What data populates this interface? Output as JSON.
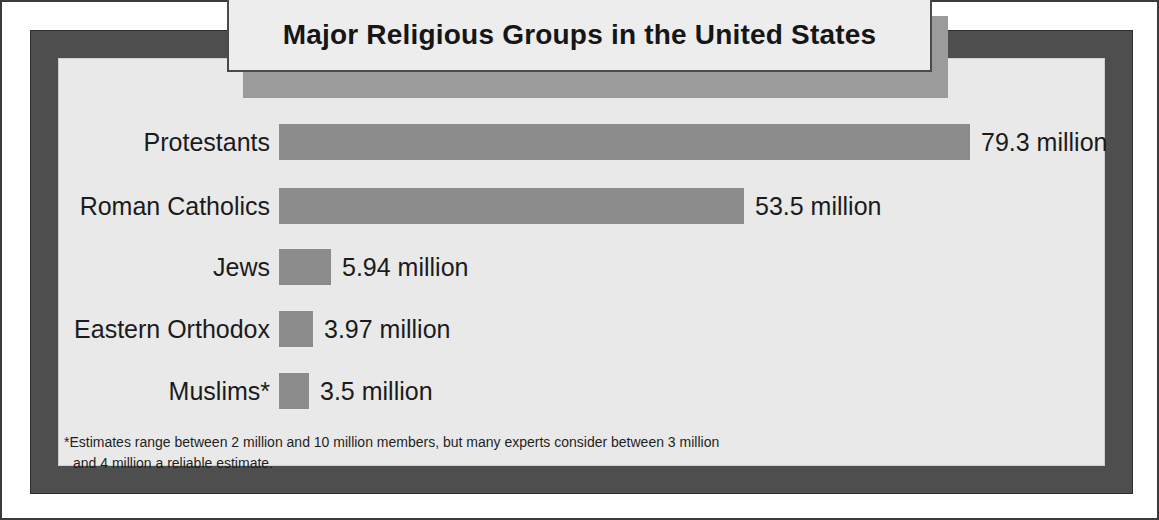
{
  "title": "Major Religious Groups  in the United States",
  "footnote": {
    "line1": "*Estimates range between 2 million and 10 million members, but many experts consider between 3 million",
    "line2": "and 4 million a reliable estimate."
  },
  "colors": {
    "bar": "#8c8c8c",
    "frame": "#4e4e4e",
    "panel": "#e9e9e9",
    "title_box": "#ededed",
    "title_shadow": "#9b9b9b",
    "text": "#1b1b1b"
  },
  "chart_data": {
    "type": "bar",
    "orientation": "horizontal",
    "title": "Major Religious Groups  in the United States",
    "xlabel": "",
    "ylabel": "",
    "unit": "million",
    "grid": false,
    "legend": false,
    "axis_visible": false,
    "categories": [
      "Protestants",
      "Roman Catholics",
      "Jews",
      "Eastern Orthodox",
      "Muslims*"
    ],
    "values": [
      79.3,
      53.5,
      5.94,
      3.97,
      3.5
    ],
    "value_labels": [
      "79.3 million",
      "53.5 million",
      "5.94 million",
      "3.97 million",
      "3.5 million"
    ],
    "bar_pixel_lengths": [
      691,
      465,
      52,
      34,
      30
    ],
    "xlim": [
      0,
      79.3
    ],
    "annotations": [
      "*Estimates range between 2 million and 10 million members, but many experts consider between 3 million and 4 million a reliable estimate."
    ]
  },
  "rows": [
    {
      "label": "Protestants",
      "value_label": "79.3 million",
      "top": 122,
      "bar_w": 691
    },
    {
      "label": "Roman Catholics",
      "value_label": "53.5 million",
      "top": 186,
      "bar_w": 465
    },
    {
      "label": "Jews",
      "value_label": "5.94 million",
      "top": 247,
      "bar_w": 52
    },
    {
      "label": "Eastern Orthodox",
      "value_label": "3.97 million",
      "top": 309,
      "bar_w": 34
    },
    {
      "label": "Muslims*",
      "value_label": "3.5 million",
      "top": 371,
      "bar_w": 30
    }
  ]
}
